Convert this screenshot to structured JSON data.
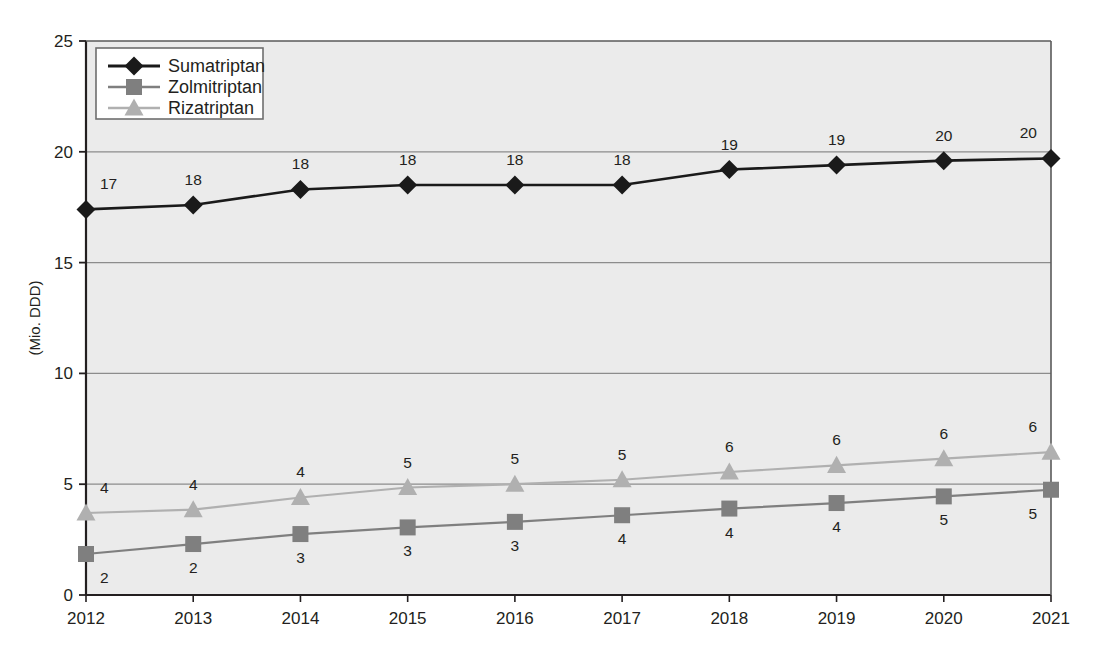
{
  "chart_data": {
    "type": "line",
    "title": "",
    "xlabel": "",
    "ylabel": "(Mio. DDD)",
    "categories": [
      "2012",
      "2013",
      "2014",
      "2015",
      "2016",
      "2017",
      "2018",
      "2019",
      "2020",
      "2021"
    ],
    "xlim": [
      2012,
      2021
    ],
    "ylim": [
      0,
      25
    ],
    "yticks": [
      "0",
      "5",
      "10",
      "15",
      "20",
      "25"
    ],
    "ytick_values": [
      0,
      5,
      10,
      15,
      20,
      25
    ],
    "grid": true,
    "legend_position": "top-left",
    "series": [
      {
        "name": "Sumatriptan",
        "color": "#1a1a1a",
        "marker": "diamond",
        "values": [
          17.4,
          17.6,
          18.3,
          18.5,
          18.5,
          18.5,
          19.2,
          19.4,
          19.6,
          19.7
        ],
        "labels": [
          "17",
          "18",
          "18",
          "18",
          "18",
          "18",
          "19",
          "19",
          "20",
          "20"
        ]
      },
      {
        "name": "Zolmitriptan",
        "color": "#7f7f7f",
        "marker": "square",
        "values": [
          1.85,
          2.3,
          2.75,
          3.05,
          3.3,
          3.6,
          3.9,
          4.15,
          4.45,
          4.75
        ],
        "labels": [
          "2",
          "2",
          "3",
          "3",
          "3",
          "4",
          "4",
          "4",
          "5",
          "5"
        ]
      },
      {
        "name": "Rizatriptan",
        "color": "#b0b0b0",
        "marker": "triangle",
        "values": [
          3.7,
          3.85,
          4.4,
          4.85,
          5.0,
          5.2,
          5.55,
          5.85,
          6.15,
          6.45
        ],
        "labels": [
          "4",
          "4",
          "4",
          "5",
          "5",
          "5",
          "6",
          "6",
          "6",
          "6"
        ]
      }
    ]
  },
  "colors": {
    "plot_background": "#ebebeb",
    "grid": "#8c8c8c",
    "axis": "#231f20",
    "legend_background": "#ffffff",
    "legend_border": "#6e6e6e",
    "sumatriptan": "#1a1a1a",
    "zolmitriptan": "#7f7f7f",
    "rizatriptan": "#b0b0b0"
  },
  "axis": {
    "y_title": "(Mio. DDD)",
    "y_ticks": [
      "25",
      "20",
      "15",
      "10",
      "5",
      "0"
    ],
    "x_ticks": [
      "2012",
      "2013",
      "2014",
      "2015",
      "2016",
      "2017",
      "2018",
      "2019",
      "2020",
      "2021"
    ]
  },
  "legend": {
    "items": [
      {
        "label": "Sumatriptan",
        "marker": "diamond-icon",
        "color": "#1a1a1a"
      },
      {
        "label": "Zolmitriptan",
        "marker": "square-icon",
        "color": "#7f7f7f"
      },
      {
        "label": "Rizatriptan",
        "marker": "triangle-icon",
        "color": "#b0b0b0"
      }
    ]
  }
}
